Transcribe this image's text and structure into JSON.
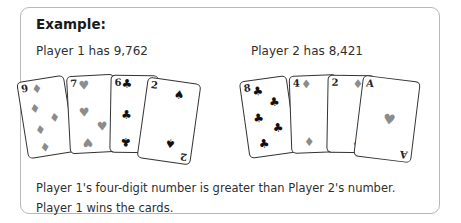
{
  "example": {
    "title": "Example:",
    "player1": {
      "label": "Player 1 has 9,762",
      "cards": [
        {
          "rank": "9",
          "suit": "diamond"
        },
        {
          "rank": "7",
          "suit": "heart"
        },
        {
          "rank": "6",
          "suit": "club"
        },
        {
          "rank": "2",
          "suit": "spade"
        }
      ]
    },
    "player2": {
      "label": "Player 2 has 8,421",
      "cards": [
        {
          "rank": "8",
          "suit": "club"
        },
        {
          "rank": "4",
          "suit": "diamond"
        },
        {
          "rank": "2",
          "suit": "diamond"
        },
        {
          "rank": "A",
          "suit": "heart"
        }
      ]
    },
    "explanation": "Player 1's four-digit number is greater than Player 2's number.",
    "result": "Player 1 wins the cards."
  },
  "colors": {
    "border": "#b8b8b8",
    "red_suit_grey": "#8c8c8c",
    "black_suit": "#111111"
  },
  "glyphs": {
    "diamond": "♦",
    "heart": "♥",
    "club": "♣",
    "spade": "♠"
  }
}
